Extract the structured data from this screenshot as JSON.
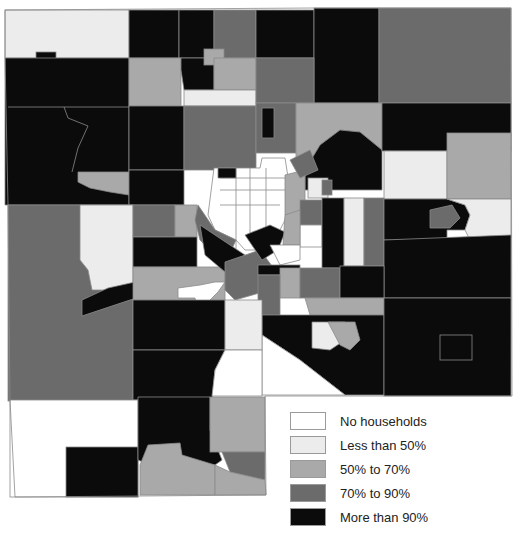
{
  "map": {
    "type": "choropleth",
    "subject": "share of households by census tract",
    "color_scale": {
      "no_households": "#ffffff",
      "less_than_50": "#ececec",
      "50_to_70": "#a9a9a9",
      "70_to_90": "#6b6b6b",
      "more_than_90": "#0b0b0b"
    }
  },
  "legend": {
    "items": [
      {
        "label": "No households",
        "color": "#ffffff"
      },
      {
        "label": "Less than 50%",
        "color": "#ececec"
      },
      {
        "label": "50% to 70%",
        "color": "#a9a9a9"
      },
      {
        "label": "70% to 90%",
        "color": "#6b6b6b"
      },
      {
        "label": "More than 90%",
        "color": "#0b0b0b"
      }
    ]
  }
}
